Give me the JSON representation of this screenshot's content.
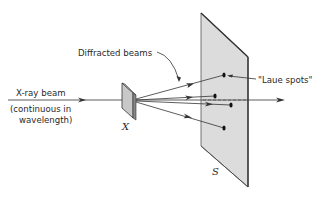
{
  "diagram": {
    "labels": {
      "incident_beam_line1": "X-ray beam",
      "incident_beam_line2": "(continuous in",
      "incident_beam_line3": "wavelength)",
      "diffracted": "Diffracted beams",
      "spots": "\"Laue spots\"",
      "crystal": "X",
      "screen": "S"
    },
    "colors": {
      "screen_fill": "#dcdcdc",
      "screen_edge": "#555555",
      "line": "#333333",
      "spot": "#111111",
      "crystal_fill": "#c8c8c8"
    },
    "components": [
      {
        "id": "crystal",
        "label": "X",
        "position": [
          129,
          100
        ]
      },
      {
        "id": "screen",
        "label": "S",
        "corners": [
          [
            201,
            13
          ],
          [
            248,
            57
          ],
          [
            248,
            187
          ],
          [
            201,
            146
          ]
        ]
      }
    ],
    "laue_spots": [
      {
        "x": 224,
        "y": 75
      },
      {
        "x": 215,
        "y": 96
      },
      {
        "x": 231,
        "y": 105
      },
      {
        "x": 224,
        "y": 128
      }
    ]
  }
}
